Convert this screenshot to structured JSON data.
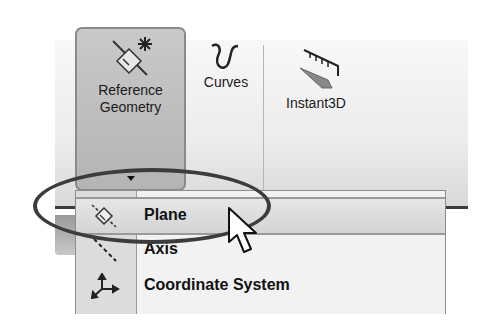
{
  "ribbon": {
    "buttons": [
      {
        "label_line1": "Reference",
        "label_line2": "Geometry",
        "icon": "reference-geometry-icon",
        "state": "pressed"
      },
      {
        "label": "Curves",
        "icon": "curves-icon"
      },
      {
        "label": "Instant3D",
        "icon": "instant3d-icon"
      }
    ]
  },
  "dropdown_menu": {
    "items": [
      {
        "label": "Plane",
        "icon": "plane-icon",
        "state": "hovered"
      },
      {
        "label": "Axis",
        "icon": "axis-icon"
      },
      {
        "label": "Coordinate System",
        "icon": "coordinate-system-icon"
      }
    ]
  },
  "annotation": {
    "shape": "ellipse",
    "target": "Plane",
    "color": "#3c3c3c"
  },
  "colors": {
    "ribbon_bg": "#ececec",
    "pressed_button": "#bcbcbc",
    "menu_bg": "#f2f2f2",
    "icon_column": "#dcdcdc"
  }
}
